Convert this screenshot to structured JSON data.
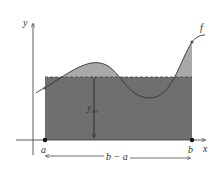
{
  "diagram": {
    "axes": {
      "x_label": "x",
      "y_label": "y"
    },
    "curve_label": "f",
    "points": {
      "a_label": "a",
      "b_label": "b"
    },
    "average_label_main": "y",
    "average_label_sub": "av",
    "width_label": "b − a",
    "colors": {
      "rectangle": "#6f6f6f",
      "curve_fill": "#a9a9a9",
      "lines": "#333333",
      "background": "#ffffff"
    }
  }
}
